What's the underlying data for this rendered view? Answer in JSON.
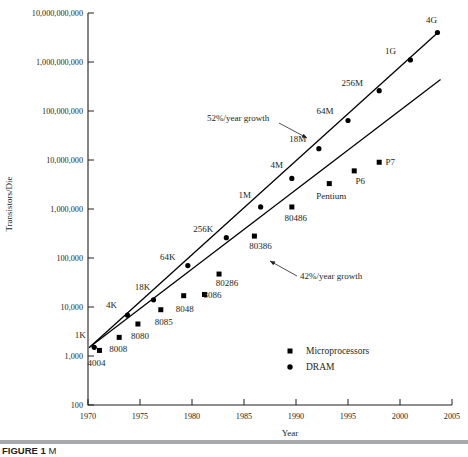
{
  "figure": {
    "caption_label": "FIGURE 1",
    "caption_text": "M",
    "rule_color": "#a7a9ac"
  },
  "chart_data": {
    "type": "scatter",
    "title": "",
    "xlabel": "Year",
    "ylabel": "Transistors/Die",
    "xlim": [
      1970,
      2005
    ],
    "ylim": [
      100,
      10000000000
    ],
    "yscale": "log",
    "grid": false,
    "xticks": [
      1970,
      1975,
      1980,
      1985,
      1990,
      1995,
      2000,
      2005
    ],
    "xticklabels": [
      "1970",
      "1975",
      "1980",
      "1985",
      "1990",
      "1995",
      "2000",
      "2005"
    ],
    "yticks": [
      100,
      1000,
      10000,
      100000,
      1000000,
      10000000,
      100000000,
      1000000000,
      10000000000
    ],
    "yticklabels": [
      "100",
      "1,000",
      "10,000",
      "100,000",
      "1,000,000",
      "10,000,000",
      "100,000,000",
      "1,000,000,000",
      "10,000,000,000"
    ],
    "marker_color": "#000000",
    "line_color": "#000000",
    "series": [
      {
        "name": "DRAM",
        "marker": "circle",
        "points": [
          {
            "label": "1K",
            "x": 1970.6,
            "y": 1500,
            "label_dx": -14,
            "label_dy": -9
          },
          {
            "label": "4K",
            "x": 1973.8,
            "y": 6800,
            "label_dx": -16,
            "label_dy": -7
          },
          {
            "label": "18K",
            "x": 1976.3,
            "y": 14000,
            "label_dx": -11,
            "label_dy": -10
          },
          {
            "label": "64K",
            "x": 1979.6,
            "y": 70000,
            "label_dx": -20,
            "label_dy": -6
          },
          {
            "label": "256K",
            "x": 1983.3,
            "y": 260000,
            "label_dx": -23,
            "label_dy": -6
          },
          {
            "label": "1M",
            "x": 1986.6,
            "y": 1100000,
            "label_dx": -16,
            "label_dy": -9
          },
          {
            "label": "4M",
            "x": 1989.6,
            "y": 4200000,
            "label_dx": -15,
            "label_dy": -10
          },
          {
            "label": "18M",
            "x": 1992.2,
            "y": 17000000,
            "label_dx": -21,
            "label_dy": -7
          },
          {
            "label": "64M",
            "x": 1995.0,
            "y": 64000000,
            "label_dx": -23,
            "label_dy": -6
          },
          {
            "label": "256M",
            "x": 1998.0,
            "y": 260000000,
            "label_dx": -27,
            "label_dy": -5
          },
          {
            "label": "1G",
            "x": 2001.0,
            "y": 1100000000,
            "label_dx": -20,
            "label_dy": -6
          },
          {
            "label": "4G",
            "x": 2003.6,
            "y": 4000000000,
            "label_dx": -6,
            "label_dy": -9
          }
        ],
        "trend": {
          "annotation": "52%/year growth",
          "rate_pct": 52,
          "x0": 1970.1,
          "y0": 1480,
          "x1": 2003.7,
          "y1": 4100000000
        }
      },
      {
        "name": "Microprocessors",
        "marker": "square",
        "points": [
          {
            "label": "4004",
            "x": 1971.1,
            "y": 1300,
            "label_dx": -3,
            "label_dy": 16
          },
          {
            "label": "8008",
            "x": 1973.0,
            "y": 2400,
            "label_dx": -1,
            "label_dy": 15
          },
          {
            "label": "8080",
            "x": 1974.8,
            "y": 4500,
            "label_dx": 2,
            "label_dy": 15
          },
          {
            "label": "8085",
            "x": 1977.0,
            "y": 8800,
            "label_dx": 3,
            "label_dy": 15
          },
          {
            "label": "8048",
            "x": 1979.2,
            "y": 17000,
            "label_dx": 1,
            "label_dy": 16
          },
          {
            "label": "8086",
            "x": 1981.2,
            "y": 18000,
            "label_dx": 8,
            "label_dy": 4
          },
          {
            "label": "80286",
            "x": 1982.6,
            "y": 47000,
            "label_dx": 8,
            "label_dy": 12
          },
          {
            "label": "80386",
            "x": 1986.0,
            "y": 280000,
            "label_dx": 6,
            "label_dy": 13
          },
          {
            "label": "80486",
            "x": 1989.6,
            "y": 1100000,
            "label_dx": 4,
            "label_dy": 14
          },
          {
            "label": "Pentium",
            "x": 1993.2,
            "y": 3300000,
            "label_dx": 2,
            "label_dy": 15
          },
          {
            "label": "P6",
            "x": 1995.6,
            "y": 6000000,
            "label_dx": 6,
            "label_dy": 13
          },
          {
            "label": "P7",
            "x": 1998.0,
            "y": 9000000,
            "label_dx": 11,
            "label_dy": 3
          }
        ],
        "trend": {
          "annotation": "42%/year growth",
          "rate_pct": 42,
          "x0": 1970.2,
          "y0": 1550,
          "x1": 2003.9,
          "y1": 440000000
        }
      }
    ],
    "annotations": [
      {
        "text": "52%/year growth",
        "text_x": 207,
        "text_y": 121,
        "anchor": "start",
        "leader": {
          "x1": 279,
          "y1": 123,
          "x2": 307,
          "y2": 138
        }
      },
      {
        "text": "42%/year growth",
        "text_x": 300,
        "text_y": 279,
        "anchor": "start",
        "leader": {
          "x1": 297,
          "y1": 276,
          "x2": 270,
          "y2": 261
        }
      }
    ],
    "legend": {
      "position": "bottom-center",
      "entries": [
        {
          "label": "Microprocessors",
          "marker": "square"
        },
        {
          "label": "DRAM",
          "marker": "circle"
        }
      ]
    }
  }
}
